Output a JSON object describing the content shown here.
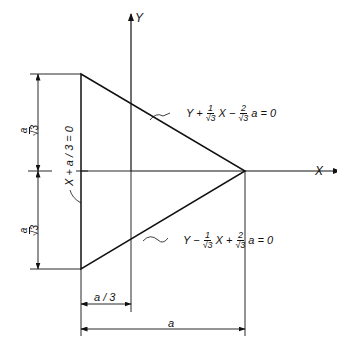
{
  "diagram": {
    "axes": {
      "x_label": "X",
      "y_label": "Y"
    },
    "lines": {
      "upper": {
        "prefix": "Y +",
        "frac1_num": "1",
        "frac1_den": "√3",
        "mid": "X −",
        "frac2_num": "2",
        "frac2_den": "√3",
        "suffix": "a = 0"
      },
      "lower": {
        "prefix": "Y −",
        "frac1_num": "1",
        "frac1_den": "√3",
        "mid": "X +",
        "frac2_num": "2",
        "frac2_den": "√3",
        "suffix": "a = 0"
      },
      "left": {
        "equation": "X + a / 3 = 0"
      }
    },
    "dimensions": {
      "upper_height": {
        "num": "a",
        "den": "√3"
      },
      "lower_height": {
        "num": "a",
        "den": "√3"
      },
      "offset": "a / 3",
      "width": "a"
    },
    "colors": {
      "line": "#111111",
      "background": "#ffffff"
    }
  }
}
